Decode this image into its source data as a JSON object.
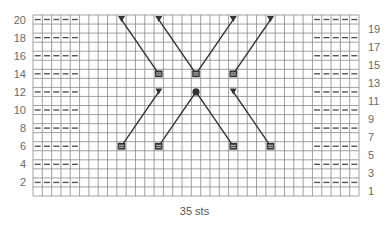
{
  "chart": {
    "title": "",
    "columns": 35,
    "rows": 20,
    "footer_label": "35 sts",
    "left_row_labels": [
      "20",
      "18",
      "16",
      "14",
      "12",
      "10",
      "8",
      "6",
      "4",
      "2"
    ],
    "right_row_labels": [
      "19",
      "17",
      "15",
      "13",
      "11",
      "9",
      "7",
      "5",
      "3",
      "1"
    ],
    "purl_rows": [
      2,
      4,
      6,
      8,
      10,
      12,
      14,
      16,
      18,
      20
    ],
    "purl_columns_left": [
      1,
      2,
      3,
      4,
      5
    ],
    "purl_columns_right": [
      31,
      32,
      33,
      34,
      35
    ],
    "cables": [
      {
        "from": {
          "col": 10,
          "row": 20,
          "symbol": "triangle"
        },
        "to": {
          "col": 14,
          "row": 14,
          "symbol": "square"
        }
      },
      {
        "from": {
          "col": 14,
          "row": 20,
          "symbol": "triangle"
        },
        "to": {
          "col": 18,
          "row": 14,
          "symbol": "square"
        }
      },
      {
        "from": {
          "col": 22,
          "row": 20,
          "symbol": "triangle"
        },
        "to": {
          "col": 18,
          "row": 14,
          "symbol": "square"
        }
      },
      {
        "from": {
          "col": 26,
          "row": 20,
          "symbol": "triangle"
        },
        "to": {
          "col": 22,
          "row": 14,
          "symbol": "square"
        }
      },
      {
        "from": {
          "col": 14,
          "row": 12,
          "symbol": "triangle"
        },
        "to": {
          "col": 10,
          "row": 6,
          "symbol": "square"
        }
      },
      {
        "from": {
          "col": 18,
          "row": 12,
          "symbol": "dot"
        },
        "to": {
          "col": 14,
          "row": 6,
          "symbol": "square"
        }
      },
      {
        "from": {
          "col": 18,
          "row": 12,
          "symbol": "dot"
        },
        "to": {
          "col": 22,
          "row": 6,
          "symbol": "square"
        }
      },
      {
        "from": {
          "col": 22,
          "row": 12,
          "symbol": "triangle"
        },
        "to": {
          "col": 26,
          "row": 6,
          "symbol": "square"
        }
      }
    ],
    "colors": {
      "grid": "#8a8a8a",
      "symbol": "#333333",
      "label": "#6a6a6a"
    }
  }
}
